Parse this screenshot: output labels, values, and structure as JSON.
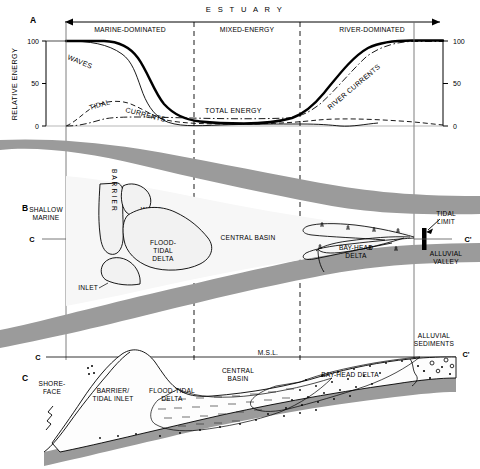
{
  "figure": {
    "title_header": "E S T U A R Y",
    "panels": [
      {
        "id": "A",
        "label": "A"
      },
      {
        "id": "B",
        "label": "B"
      },
      {
        "id": "C",
        "label": "C"
      }
    ]
  },
  "zones": [
    {
      "name": "marine-dominated",
      "label": "MARINE-DOMINATED"
    },
    {
      "name": "mixed-energy",
      "label": "MIXED-ENERGY"
    },
    {
      "name": "river-dominated",
      "label": "RIVER-DOMINATED"
    }
  ],
  "panel_a": {
    "axis_title": "RELATIVE ENERGY",
    "ticks_left": [
      "100",
      "50",
      "0"
    ],
    "ticks_right": [
      "100",
      "50",
      "0"
    ],
    "curves": [
      {
        "name": "waves",
        "label": "WAVES",
        "style": "thin-solid"
      },
      {
        "name": "tidal-currents",
        "label": "TIDAL   CURRENTS",
        "style": "dashed"
      },
      {
        "name": "total-energy",
        "label": "TOTAL ENERGY",
        "style": "thick-solid"
      },
      {
        "name": "river-currents",
        "label": "RIVER CURRENTS",
        "style": "dash-dot"
      }
    ],
    "curve_labels": {
      "waves": "WAVES",
      "tidal": "TIDAL",
      "currents": "CURRENTS",
      "total": "TOTAL ENERGY",
      "river": "RIVER CURRENTS"
    }
  },
  "panel_b": {
    "features": [
      {
        "name": "shallow-marine",
        "line1": "SHALLOW",
        "line2": "MARINE"
      },
      {
        "name": "barrier",
        "label": "B A R R I E R"
      },
      {
        "name": "washovers",
        "line1": "WASH-",
        "line2": "OVERS"
      },
      {
        "name": "inlet",
        "label": "INLET"
      },
      {
        "name": "flood-tidal-delta",
        "line1": "FLOOD-",
        "line2": "TIDAL",
        "line3": "DELTA"
      },
      {
        "name": "central-basin",
        "label": "CENTRAL BASIN"
      },
      {
        "name": "bay-head-delta",
        "line1": "BAY-HEAD",
        "line2": "DELTA"
      },
      {
        "name": "tidal-limit",
        "line1": "TIDAL",
        "line2": "LIMIT"
      },
      {
        "name": "alluvial-valley",
        "line1": "ALLUVIAL",
        "line2": "VALLEY"
      }
    ],
    "section_left": "C",
    "section_right": "C'"
  },
  "panel_c": {
    "section_left": "C",
    "section_right": "C'",
    "msl": "M.S.L.",
    "features": [
      {
        "name": "shoreface",
        "line1": "SHORE-",
        "line2": "FACE"
      },
      {
        "name": "barrier-tidal-inlet",
        "line1": "BARRIER/",
        "line2": "TIDAL INLET"
      },
      {
        "name": "flood-tidal-delta",
        "line1": "FLOOD-TIDAL",
        "line2": "DELTA"
      },
      {
        "name": "central-basin",
        "line1": "CENTRAL",
        "line2": "BASIN"
      },
      {
        "name": "bay-head-delta",
        "label": "BAY-HEAD DELTA"
      },
      {
        "name": "alluvial-sediments",
        "line1": "ALLUVIAL",
        "line2": "SEDIMENTS"
      }
    ]
  },
  "colors": {
    "land_gray": "#9b9b9b",
    "basin_fill": "#f4f4f4",
    "line": "#000000",
    "white": "#ffffff"
  }
}
